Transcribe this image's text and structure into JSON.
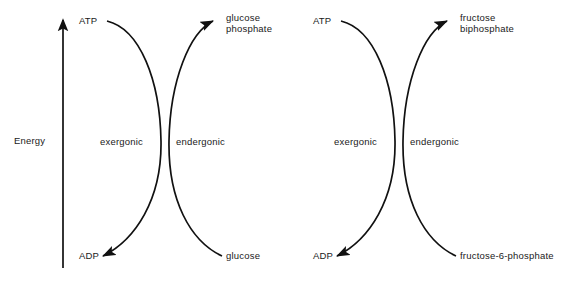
{
  "diagram": {
    "background_color": "#ffffff",
    "stroke_color": "#111111",
    "text_color": "#1a1a1a",
    "axis": {
      "label": "Energy",
      "direction": "up",
      "arrow_icon": "up-arrow-icon"
    },
    "panels": [
      {
        "id": "left",
        "name": "glucose-phosphorylation",
        "reactant_top": "ATP",
        "product_bottom": "ADP",
        "reactant_bottom": "glucose",
        "product_top": "glucose\nphosphate",
        "left_curve_label": "exergonic",
        "right_curve_label": "endergonic"
      },
      {
        "id": "right",
        "name": "fructose-phosphorylation",
        "reactant_top": "ATP",
        "product_bottom": "ADP",
        "reactant_bottom": "fructose-6-phosphate",
        "product_top": "fructose\nbiphosphate",
        "left_curve_label": "exergonic",
        "right_curve_label": "endergonic"
      }
    ]
  }
}
